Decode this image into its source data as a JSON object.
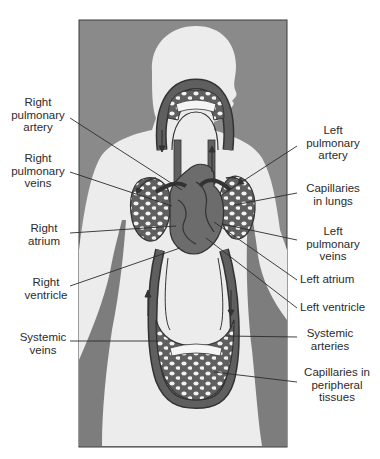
{
  "figure": {
    "colors": {
      "background_panel": "#8a8a8a",
      "body_silhouette": "#ececec",
      "body_shadow": "#7d7d7d",
      "vessels": "#5f5f5f",
      "vessel_outline": "#333333",
      "capillary_holes": "#f5f5f5",
      "leader_lines": "#2b2b2b",
      "label_text": "#2b2b2b"
    }
  },
  "labels": {
    "left": [
      {
        "id": "right-pulmonary-artery",
        "text": "Right\npulmonary\nartery"
      },
      {
        "id": "right-pulmonary-veins",
        "text": "Right\npulmonary\nveins"
      },
      {
        "id": "right-atrium",
        "text": "Right\natrium"
      },
      {
        "id": "right-ventricle",
        "text": "Right\nventricle"
      },
      {
        "id": "systemic-veins",
        "text": "Systemic\nveins"
      }
    ],
    "right": [
      {
        "id": "left-pulmonary-artery",
        "text": "Left\npulmonary\nartery"
      },
      {
        "id": "capillaries-in-lungs",
        "text": "Capillaries\nin lungs"
      },
      {
        "id": "left-pulmonary-veins",
        "text": "Left\npulmonary\nveins"
      },
      {
        "id": "left-atrium",
        "text": "Left atrium"
      },
      {
        "id": "left-ventricle",
        "text": "Left ventricle"
      },
      {
        "id": "systemic-arteries",
        "text": "Systemic\narteries"
      },
      {
        "id": "capillaries-in-peripheral-tissues",
        "text": "Capillaries in\nperipheral\ntissues"
      }
    ]
  },
  "flow_arrows": [
    {
      "id": "arrow-head-loop-down",
      "direction": "down"
    },
    {
      "id": "arrow-head-loop-up",
      "direction": "up"
    },
    {
      "id": "arrow-right-lung-curve",
      "direction": "curved"
    },
    {
      "id": "arrow-left-lung-curve",
      "direction": "curved"
    },
    {
      "id": "arrow-systemic-veins-up",
      "direction": "up"
    },
    {
      "id": "arrow-systemic-arteries-down",
      "direction": "down"
    }
  ]
}
